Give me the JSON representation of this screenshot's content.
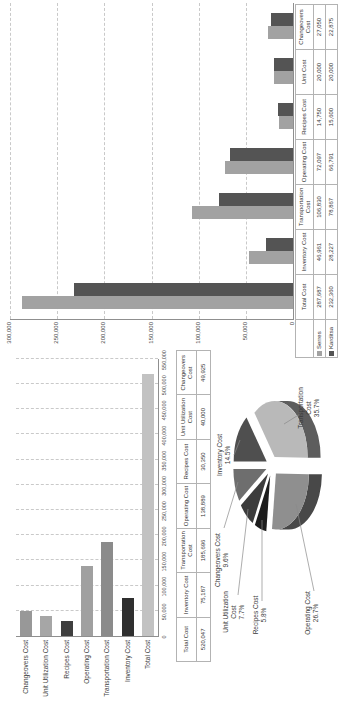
{
  "page": {
    "background": "#ffffff",
    "description_colors": {
      "axis": "#8f8f8f",
      "grid": "#c9c9c9",
      "table_border": "#b3b3b3"
    }
  },
  "chart_data": [
    {
      "name": "total-costs-bar-chart",
      "type": "bar",
      "orientation": "horizontal",
      "categories": [
        "Changeovers Cost",
        "Unit Utilization Cost",
        "Recipes Cost",
        "Operating Cost",
        "Transportation Cost",
        "Inventory Cost",
        "Total Cost"
      ],
      "values": [
        49925,
        40000,
        30350,
        138889,
        185696,
        75187,
        520047
      ],
      "bar_colors": [
        "#989898",
        "#a6a6a6",
        "#3f3f3f",
        "#a0a0a0",
        "#8b8b8b",
        "#2f2f2f",
        "#c2c2c2"
      ],
      "xlim": [
        0,
        550000
      ],
      "x_ticks": [
        "0",
        "50,000",
        "100,000",
        "150,000",
        "200,000",
        "250,000",
        "300,000",
        "350,000",
        "400,000",
        "450,000",
        "500,000",
        "550,000"
      ],
      "grid": true,
      "table": {
        "headers": [
          "Total Cost",
          "Inventory Cost",
          "Transportation Cost",
          "Operating Cost",
          "Recipes Cost",
          "Unit Utilization Cost",
          "Changeovers Cost"
        ],
        "values": [
          "520,047",
          "75,187",
          "185,696",
          "138,889",
          "30,350",
          "40,000",
          "49,925"
        ]
      }
    },
    {
      "name": "cost-breakdown-pie-chart",
      "type": "pie",
      "slices": [
        {
          "label": "Inventory Cost",
          "label_lines": [
            "Inventory Cost"
          ],
          "pct": "14.5%",
          "value": 14.5,
          "color": "#4f4f4f"
        },
        {
          "label": "Transportation Cost",
          "label_lines": [
            "Transportation",
            "Cost"
          ],
          "pct": "35.7%",
          "value": 35.7,
          "color": "#b9b9b9"
        },
        {
          "label": "Operating Cost",
          "label_lines": [
            "Operating Cost"
          ],
          "pct": "26.7%",
          "value": 26.7,
          "color": "#8f8f8f"
        },
        {
          "label": "Recipes Cost",
          "label_lines": [
            "Recipes Cost"
          ],
          "pct": "5.8%",
          "value": 5.8,
          "color": "#1c1c1c"
        },
        {
          "label": "Unit Utilization Cost",
          "label_lines": [
            "Unit Utilization",
            "Cost"
          ],
          "pct": "7.7%",
          "value": 7.7,
          "color": "#3c3c3c"
        },
        {
          "label": "Changeovers Cost",
          "label_lines": [
            "Changeovers Cost"
          ],
          "pct": "9.6%",
          "value": 9.6,
          "color": "#6e6e6e"
        }
      ]
    },
    {
      "name": "scenario-comparison-chart",
      "type": "bar",
      "orientation": "vertical",
      "categories": [
        "Total Cost",
        "Inventory Cost",
        "Transportation Cost",
        "Operating Cost",
        "Recipes Cost",
        "Unit Cost",
        "Changeovers Cost"
      ],
      "series": [
        {
          "name": "Serres",
          "color": "#a2a2a2",
          "values": [
            287687,
            46961,
            106830,
            72097,
            14750,
            20000,
            27050
          ],
          "labels": [
            "287,687",
            "46,961",
            "106,830",
            "72,097",
            "14,750",
            "20,000",
            "27,050"
          ]
        },
        {
          "name": "Karditsa",
          "color": "#545454",
          "values": [
            232360,
            28227,
            78867,
            66791,
            15600,
            20000,
            22875
          ],
          "labels": [
            "232,360",
            "28,227",
            "78,867",
            "66,791",
            "15,600",
            "20,000",
            "22,875"
          ]
        }
      ],
      "ylim": [
        0,
        300000
      ],
      "y_ticks": [
        "0",
        "50,000",
        "100,000",
        "150,000",
        "200,000",
        "250,000",
        "300,000"
      ],
      "grid": true,
      "legend_position": "table-left"
    }
  ]
}
